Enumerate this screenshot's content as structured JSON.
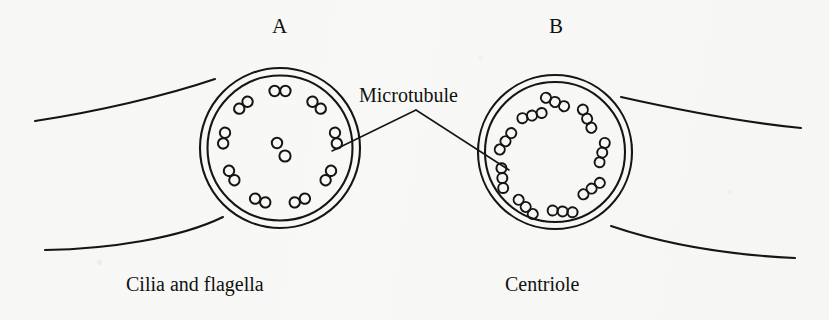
{
  "figure": {
    "background_color": "#f8f8f6",
    "ink_color": "#111111"
  },
  "panels": [
    {
      "letter": "A",
      "caption": "Cilia and flagella",
      "arrangement": "9+2",
      "center": [
        280,
        148
      ],
      "outer_radius": 80,
      "inner_radius": 73,
      "peripheral_groups": 9,
      "tubules_per_group": 2,
      "central_singlets": 2,
      "tubule_radius": 5.2
    },
    {
      "letter": "B",
      "caption": "Centriole",
      "arrangement": "9+0",
      "center": [
        555,
        152
      ],
      "outer_radius": 77,
      "inner_radius": 70,
      "peripheral_groups": 9,
      "tubules_per_group": 3,
      "central_singlets": 0,
      "tubule_radius": 5.0
    }
  ],
  "annotation": {
    "label": "Microtubule",
    "apex": [
      416,
      110
    ],
    "left_endpoint": [
      333,
      151
    ],
    "right_endpoint": [
      508,
      170
    ]
  },
  "membrane": {
    "upper_left": {
      "start": [
        35,
        121
      ],
      "end": [
        214,
        80
      ]
    },
    "lower_left": {
      "start": [
        45,
        250
      ],
      "end": [
        222,
        218
      ]
    },
    "upper_right": {
      "start": [
        622,
        98
      ],
      "end": [
        800,
        128
      ]
    },
    "lower_right": {
      "start": [
        612,
        226
      ],
      "end": [
        795,
        258
      ]
    }
  }
}
